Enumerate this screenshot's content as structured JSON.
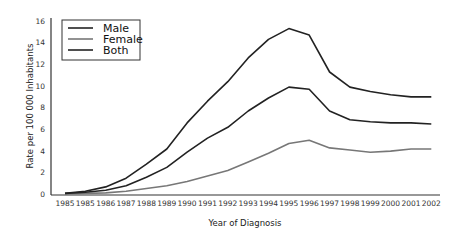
{
  "chart_data": {
    "type": "line",
    "title": "",
    "xlabel": "Year of Diagnosis",
    "ylabel": "Rate per 100 000 Inhabitants",
    "ylim": [
      0,
      16
    ],
    "yticks": [
      0,
      2,
      4,
      6,
      8,
      10,
      12,
      14,
      16
    ],
    "categories": [
      "1985",
      "1985",
      "1986",
      "1987",
      "1988",
      "1989",
      "1990",
      "1991",
      "1992",
      "1993",
      "1994",
      "1995",
      "1996",
      "1997",
      "1998",
      "1999",
      "2000",
      "2001",
      "2002"
    ],
    "grid": false,
    "legend_position": "upper left",
    "series": [
      {
        "name": "Male",
        "color": "#222222",
        "values": [
          0.1,
          0.3,
          0.7,
          1.5,
          2.8,
          4.2,
          6.6,
          8.6,
          10.4,
          12.6,
          14.3,
          15.3,
          14.7,
          11.3,
          9.9,
          9.5,
          9.2,
          9.0,
          9.0
        ]
      },
      {
        "name": "Female",
        "color": "#777777",
        "values": [
          0.05,
          0.1,
          0.15,
          0.3,
          0.55,
          0.8,
          1.2,
          1.7,
          2.2,
          3.0,
          3.8,
          4.7,
          5.0,
          4.3,
          4.1,
          3.9,
          4.0,
          4.2,
          4.2
        ]
      },
      {
        "name": "Both",
        "color": "#222222",
        "values": [
          0.1,
          0.2,
          0.4,
          0.8,
          1.6,
          2.5,
          3.9,
          5.2,
          6.2,
          7.7,
          8.9,
          9.9,
          9.7,
          7.7,
          6.9,
          6.7,
          6.6,
          6.6,
          6.5
        ]
      }
    ]
  }
}
